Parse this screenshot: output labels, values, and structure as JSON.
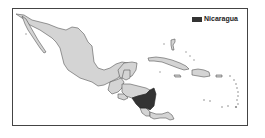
{
  "map": {
    "region": "Mexico, Central America and the Caribbean",
    "highlighted_country": "Nicaragua",
    "colors": {
      "land": "#d4d4d4",
      "highlight": "#333333",
      "border": "#555555",
      "frame": "#444444",
      "background": "#ffffff"
    }
  },
  "legend": {
    "items": [
      {
        "label": "Nicaragua",
        "color": "#333333"
      }
    ]
  }
}
